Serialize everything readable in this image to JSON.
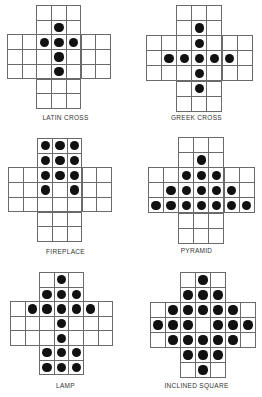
{
  "figure": {
    "grid_size": 7,
    "board_shape": "english-cross-33-holes",
    "puzzles": [
      {
        "name": "LATIN CROSS",
        "origin": [
          7,
          5
        ],
        "cell": 14.7,
        "label_y": 114,
        "pegs": [
          [
            1,
            3
          ],
          [
            2,
            2
          ],
          [
            2,
            3
          ],
          [
            2,
            4
          ],
          [
            3,
            3
          ],
          [
            4,
            3
          ]
        ]
      },
      {
        "name": "GREEK CROSS",
        "origin": [
          146,
          5
        ],
        "cell": 15.1,
        "label_y": 114,
        "pegs": [
          [
            1,
            3
          ],
          [
            2,
            3
          ],
          [
            3,
            1
          ],
          [
            3,
            2
          ],
          [
            3,
            3
          ],
          [
            3,
            4
          ],
          [
            3,
            5
          ],
          [
            4,
            3
          ],
          [
            5,
            3
          ]
        ]
      },
      {
        "name": "FIREPLACE",
        "origin": [
          8,
          138
        ],
        "cell": 14.7,
        "label_y": 248,
        "pegs": [
          [
            0,
            2
          ],
          [
            0,
            3
          ],
          [
            0,
            4
          ],
          [
            1,
            2
          ],
          [
            1,
            3
          ],
          [
            1,
            4
          ],
          [
            2,
            2
          ],
          [
            2,
            3
          ],
          [
            2,
            4
          ],
          [
            3,
            2
          ],
          [
            3,
            4
          ]
        ]
      },
      {
        "name": "PYRAMID",
        "origin": [
          148,
          137
        ],
        "cell": 15.1,
        "label_y": 247,
        "pegs": [
          [
            1,
            3
          ],
          [
            2,
            2
          ],
          [
            2,
            3
          ],
          [
            2,
            4
          ],
          [
            3,
            1
          ],
          [
            3,
            2
          ],
          [
            3,
            3
          ],
          [
            3,
            4
          ],
          [
            3,
            5
          ],
          [
            4,
            0
          ],
          [
            4,
            1
          ],
          [
            4,
            2
          ],
          [
            4,
            3
          ],
          [
            4,
            4
          ],
          [
            4,
            5
          ],
          [
            4,
            6
          ]
        ]
      },
      {
        "name": "LAMP",
        "origin": [
          10,
          272
        ],
        "cell": 14.6,
        "label_y": 382,
        "pegs": [
          [
            0,
            3
          ],
          [
            1,
            2
          ],
          [
            1,
            3
          ],
          [
            1,
            4
          ],
          [
            2,
            1
          ],
          [
            2,
            2
          ],
          [
            2,
            3
          ],
          [
            2,
            4
          ],
          [
            2,
            5
          ],
          [
            3,
            3
          ],
          [
            4,
            3
          ],
          [
            5,
            2
          ],
          [
            5,
            3
          ],
          [
            5,
            4
          ],
          [
            6,
            2
          ],
          [
            6,
            3
          ],
          [
            6,
            4
          ]
        ]
      },
      {
        "name": "INCLINED SQUARE",
        "origin": [
          150,
          272
        ],
        "cell": 15.0,
        "label_y": 382,
        "pegs": [
          [
            0,
            3
          ],
          [
            1,
            2
          ],
          [
            1,
            3
          ],
          [
            1,
            4
          ],
          [
            2,
            1
          ],
          [
            2,
            2
          ],
          [
            2,
            3
          ],
          [
            2,
            4
          ],
          [
            2,
            5
          ],
          [
            3,
            0
          ],
          [
            3,
            1
          ],
          [
            3,
            2
          ],
          [
            3,
            4
          ],
          [
            3,
            5
          ],
          [
            3,
            6
          ],
          [
            4,
            1
          ],
          [
            4,
            2
          ],
          [
            4,
            3
          ],
          [
            4,
            4
          ],
          [
            4,
            5
          ],
          [
            5,
            2
          ],
          [
            5,
            3
          ],
          [
            5,
            4
          ],
          [
            6,
            3
          ]
        ]
      }
    ]
  }
}
